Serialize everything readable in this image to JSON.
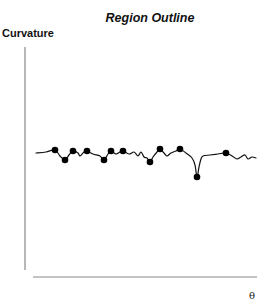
{
  "chart_data": {
    "type": "line",
    "title": "Region Outline",
    "xlabel": "θ",
    "ylabel": "Curvature",
    "grid": false,
    "legend": null,
    "axes": {
      "y_axis": {
        "x": 25,
        "y1": 47,
        "y2": 270
      },
      "x_axis": {
        "y": 277,
        "x1": 33,
        "x2": 257
      }
    },
    "curve_points": [
      [
        36,
        153
      ],
      [
        46,
        152
      ],
      [
        55,
        150
      ],
      [
        60,
        156
      ],
      [
        65,
        160
      ],
      [
        69,
        155
      ],
      [
        73,
        151
      ],
      [
        78,
        153
      ],
      [
        80,
        156
      ],
      [
        84,
        152
      ],
      [
        87,
        151
      ],
      [
        93,
        154
      ],
      [
        100,
        156
      ],
      [
        104,
        160
      ],
      [
        108,
        154
      ],
      [
        111,
        151
      ],
      [
        116,
        154
      ],
      [
        120,
        152
      ],
      [
        123,
        151
      ],
      [
        129,
        154
      ],
      [
        134,
        152
      ],
      [
        138,
        156
      ],
      [
        141,
        152
      ],
      [
        144,
        157
      ],
      [
        147,
        158
      ],
      [
        150,
        162
      ],
      [
        153,
        157
      ],
      [
        157,
        152
      ],
      [
        160,
        149
      ],
      [
        164,
        153
      ],
      [
        167,
        156
      ],
      [
        171,
        153
      ],
      [
        176,
        151
      ],
      [
        180,
        149
      ],
      [
        186,
        153
      ],
      [
        192,
        158
      ],
      [
        195,
        165
      ],
      [
        197,
        177
      ],
      [
        199,
        167
      ],
      [
        201,
        159
      ],
      [
        203,
        156
      ],
      [
        210,
        155
      ],
      [
        218,
        154
      ],
      [
        226,
        153
      ],
      [
        232,
        156
      ],
      [
        237,
        159
      ],
      [
        241,
        157
      ],
      [
        245,
        155
      ],
      [
        248,
        159
      ],
      [
        252,
        157
      ],
      [
        256,
        158
      ]
    ],
    "marked_points": [
      [
        55,
        150
      ],
      [
        65,
        160
      ],
      [
        73,
        151
      ],
      [
        87,
        151
      ],
      [
        104,
        160
      ],
      [
        111,
        151
      ],
      [
        123,
        151
      ],
      [
        150,
        162
      ],
      [
        160,
        149
      ],
      [
        180,
        149
      ],
      [
        197,
        177
      ],
      [
        226,
        153
      ]
    ],
    "colors": {
      "line": "#111111",
      "markers": "#000000",
      "axis": "#888888"
    }
  },
  "labels": {
    "title": "Region Outline",
    "ylabel": "Curvature",
    "xlabel": "θ"
  }
}
